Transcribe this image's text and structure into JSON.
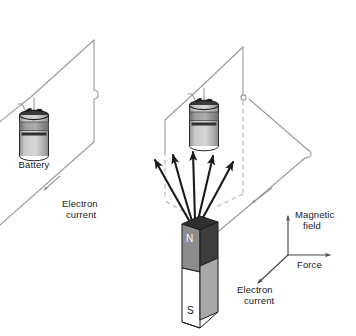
{
  "figure": {
    "type": "physics-diagram",
    "background_color": "#ffffff",
    "wire_color": "#9a9a9a",
    "arrow_color": "#1b1b1b",
    "text_color": "#1b1b1b"
  },
  "left_panel": {
    "battery_label": "Battery",
    "current_label_line1": "Electron",
    "current_label_line2": "current"
  },
  "right_panel": {
    "current_label_line1": "Electron",
    "current_label_line2": "current"
  },
  "magnet": {
    "north_label": "N",
    "south_label": "S",
    "north_face_color": "#8c8c8c",
    "south_face_color": "#fdfdfd",
    "side_face_color": "#3d3d3d",
    "south_side_color": "#a8a8a8",
    "outline_color": "#1b1b1b"
  },
  "axes_key": {
    "magnetic_field_line1": "Magnetic",
    "magnetic_field_line2": "field",
    "force_label": "Force",
    "electron_current_line1": "Electron",
    "electron_current_line2": "current"
  },
  "field_arrows": {
    "count": 5,
    "description": "magnetic-field-lines-from-north-pole"
  }
}
